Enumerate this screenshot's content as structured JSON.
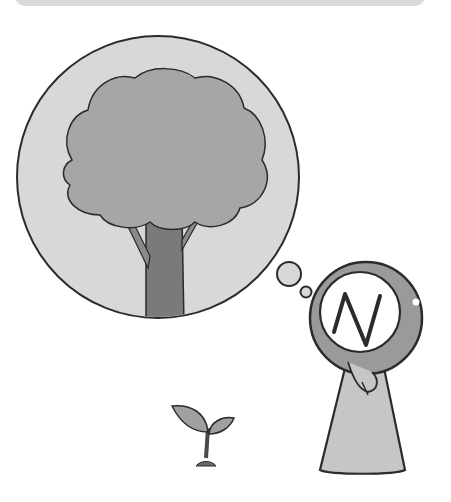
{
  "scene": {
    "description": "Illustration of a character with a circular head marked with the letter N, thinking of a large tree while a small sprout grows nearby",
    "character": {
      "face_letter": "N"
    },
    "thought_bubble": {
      "content": "tree"
    },
    "ground_object": "sprout"
  },
  "colors": {
    "bubble_fill": "#d8d8d8",
    "canopy_fill": "#a6a6a6",
    "trunk_fill": "#7a7a7a",
    "head_fill": "#9a9a9a",
    "body_fill": "#c6c6c6",
    "outline": "#2b2b2b",
    "banner": "#d9d9d9"
  }
}
